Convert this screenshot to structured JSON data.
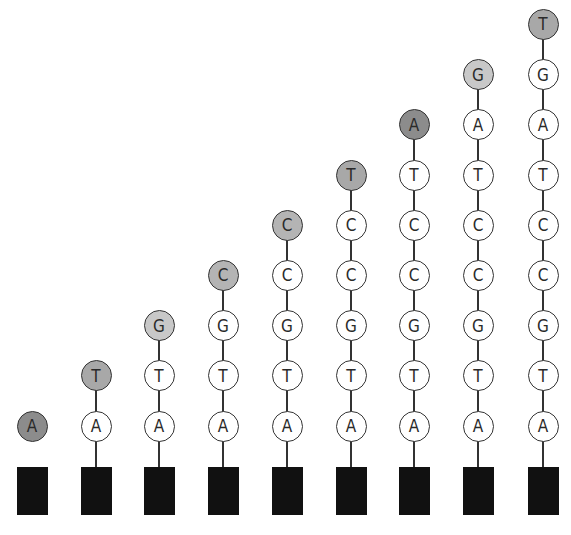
{
  "diagram": {
    "colors": {
      "bar": "#111111",
      "line": "#333333",
      "base_fill": "#ffffff",
      "new_base_fill": {
        "A": "#8c8c8c",
        "T": "#a8a8a8",
        "G": "#c8c8c8",
        "C": "#b4b4b4"
      }
    },
    "strands": [
      {
        "bases": [
          "A"
        ]
      },
      {
        "bases": [
          "A",
          "T"
        ]
      },
      {
        "bases": [
          "A",
          "T",
          "G"
        ]
      },
      {
        "bases": [
          "A",
          "T",
          "G",
          "C"
        ]
      },
      {
        "bases": [
          "A",
          "T",
          "G",
          "C",
          "C"
        ]
      },
      {
        "bases": [
          "A",
          "T",
          "G",
          "C",
          "C",
          "T"
        ]
      },
      {
        "bases": [
          "A",
          "T",
          "G",
          "C",
          "C",
          "T",
          "A"
        ]
      },
      {
        "bases": [
          "A",
          "T",
          "G",
          "C",
          "C",
          "T",
          "A",
          "G"
        ]
      },
      {
        "bases": [
          "A",
          "T",
          "G",
          "C",
          "C",
          "T",
          "A",
          "G",
          "T"
        ]
      }
    ]
  }
}
